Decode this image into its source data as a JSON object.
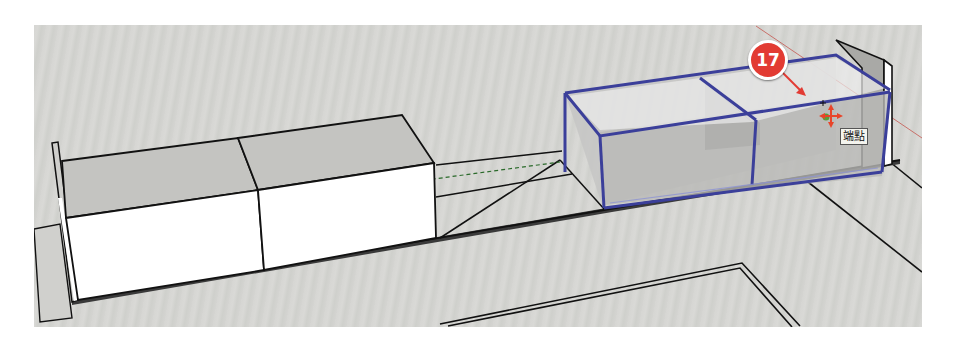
{
  "app": "SketchUp 3D modeling viewport",
  "viewport": {
    "background_color": "#d5d5d2",
    "selection_color": "#3b3f9a",
    "red_axis_color": "#c0504d"
  },
  "callout": {
    "number": "17",
    "color": "#e23b33"
  },
  "inference_tooltip": {
    "label": "端點"
  },
  "cursor": {
    "tool": "move-tool",
    "color": "#e8452a"
  },
  "model": {
    "solid_boxes": [
      "left-cabinet-section",
      "middle-cabinet-section"
    ],
    "selected_group": "glass-cabinet-component",
    "end_panels": [
      "left-end-panel",
      "right-end-panel"
    ]
  }
}
